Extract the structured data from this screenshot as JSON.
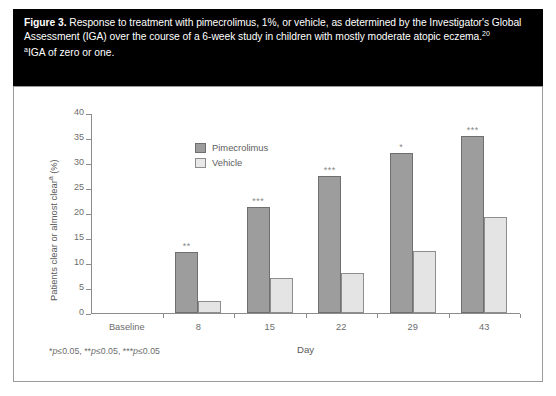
{
  "caption": {
    "figure_label": "Figure 3.",
    "text_part1": " Response to treatment with pimecrolimus, 1%, or vehicle, as determined by the Investigator's Global Assessment (IGA) over the course of a 6-week study in children with mostly moderate atopic eczema.",
    "reference_superscript": "20",
    "note_marker": "a",
    "note_text": "IGA of zero or one."
  },
  "chart_data": {
    "type": "bar",
    "title": "",
    "subtitle": "",
    "xlabel": "Day",
    "ylabel": "Patients clear or almost clear",
    "ylabel_superscript": "a",
    "ylabel_unit": " (%)",
    "categories": [
      "Baseline",
      "8",
      "15",
      "22",
      "29",
      "43"
    ],
    "series": [
      {
        "name": "Pimecrolimus",
        "color": "#9d9d9d",
        "values": [
          0,
          12.2,
          21.2,
          27.5,
          32.0,
          35.5
        ],
        "significance": [
          "",
          "**",
          "***",
          "***",
          "*",
          "***"
        ]
      },
      {
        "name": "Vehicle",
        "color": "#e4e4e4",
        "values": [
          0,
          2.5,
          7.0,
          8.0,
          12.5,
          19.3
        ],
        "significance": [
          "",
          "",
          "",
          "",
          "",
          ""
        ]
      }
    ],
    "ylim": [
      0,
      40
    ],
    "yticks": [
      0,
      5,
      10,
      15,
      20,
      25,
      30,
      35,
      40
    ],
    "ytick_labels": [
      "0",
      "5",
      "10",
      "15",
      "20",
      "25",
      "30",
      "35",
      "40"
    ],
    "grid": false,
    "legend_position": "top-left"
  },
  "footnote": {
    "segments": [
      "*",
      "p",
      "≤0.05, ",
      "**",
      "p",
      "≤0.05, ",
      "***",
      "p",
      "≤0.05"
    ],
    "full_text": "*p≤0.05, **p≤0.05, ***p≤0.05"
  },
  "colors": {
    "caption_background": "#000000",
    "caption_text": "#ffffff",
    "frame_border": "#9a9a9a",
    "axis": "#8c8c8c",
    "tick_text": "#6d6d6d",
    "series_pimecrolimus": "#9d9d9d",
    "series_vehicle": "#e4e4e4"
  }
}
